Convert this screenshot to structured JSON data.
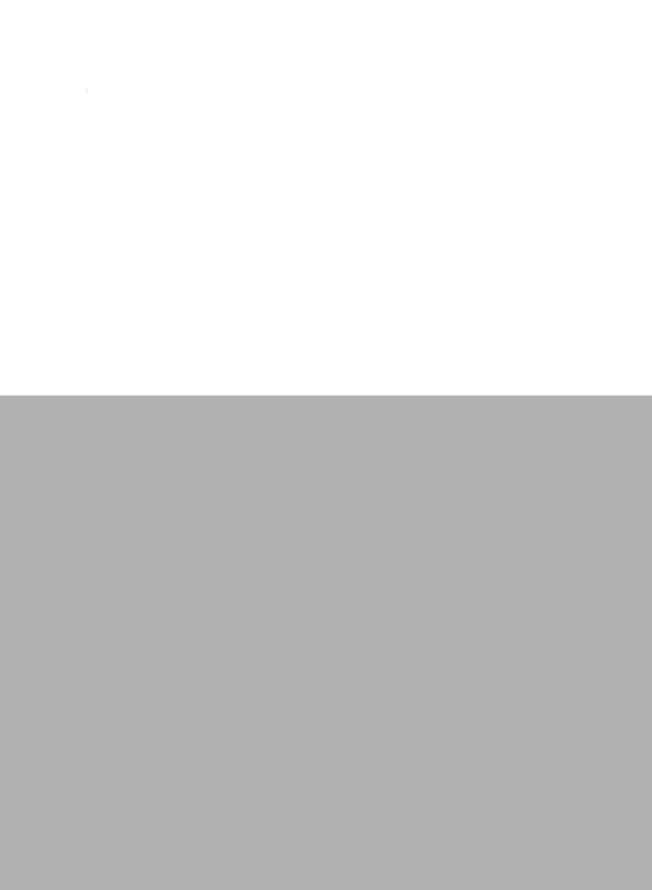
{
  "page": {
    "top_region": {
      "background": "#ffffff",
      "text": ""
    },
    "bottom_region": {
      "background": "#b1b1b1",
      "text": ""
    }
  }
}
